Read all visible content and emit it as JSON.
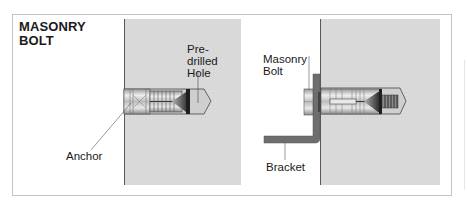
{
  "title": {
    "line1": "MASONRY",
    "line2": "BOLT"
  },
  "left_panel": {
    "labels": {
      "hole_line1": "Pre-",
      "hole_line2": "drilled",
      "hole_line3": "Hole",
      "anchor": "Anchor"
    }
  },
  "right_panel": {
    "labels": {
      "bolt_line1": "Masonry",
      "bolt_line2": "Bolt",
      "bracket": "Bracket"
    }
  },
  "colors": {
    "wall": "#d9d9d9",
    "bracket": "#6e6e6e",
    "frame_border": "#c4c4c4",
    "text": "#1a1a1a"
  }
}
